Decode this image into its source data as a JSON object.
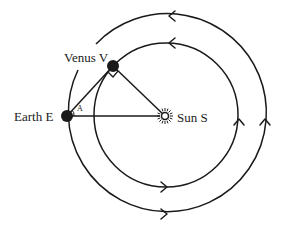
{
  "diagram": {
    "type": "orbital-geometry",
    "colors": {
      "stroke": "#1a1a1a",
      "background": "#ffffff"
    },
    "bodies": {
      "venus": {
        "label": "Venus V",
        "cx": 113,
        "cy": 66,
        "r": 6
      },
      "earth": {
        "label": "Earth E",
        "cx": 67,
        "cy": 116,
        "r": 6
      },
      "sun": {
        "label": "Sun S",
        "cx": 165,
        "cy": 116
      }
    },
    "orbits": {
      "inner": {
        "name": "Venus orbit",
        "cx": 166,
        "cy": 115,
        "r": 72,
        "direction": "counterclockwise"
      },
      "outer": {
        "name": "Earth orbit",
        "cx": 166,
        "cy": 115,
        "r": 99,
        "direction": "counterclockwise"
      }
    },
    "angle_label": "A",
    "right_angle_at": "Venus V",
    "triangle": [
      "Earth E",
      "Venus V",
      "Sun S"
    ]
  }
}
